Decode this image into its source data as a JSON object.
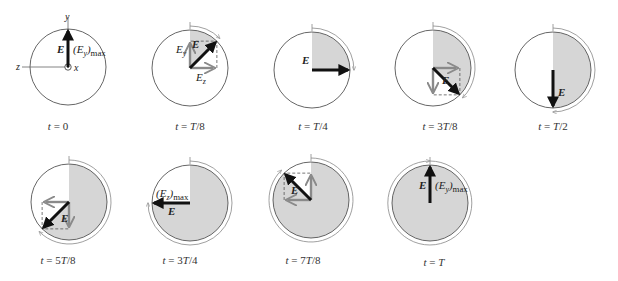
{
  "figure": {
    "colors": {
      "circle_stroke": "#555555",
      "shade_fill": "#d6d6d6",
      "e_vector": "#111111",
      "component_vector": "#8a8a8a",
      "sweep_arc": "#888888",
      "axis": "#666666"
    },
    "radius": 38,
    "panels": [
      {
        "id": "t0",
        "caption": "t = 0",
        "cx": 68,
        "cy": 67,
        "angle_deg": 0,
        "caption_x": 58,
        "caption_y": 130,
        "axes": true,
        "axis_labels": {
          "y": "y",
          "z": "z",
          "x": "x"
        },
        "e_label": "E",
        "mag_label": "(E_y)max",
        "components": false
      },
      {
        "id": "t_T8",
        "caption": "t = T/8",
        "cx": 190,
        "cy": 68,
        "angle_deg": 45,
        "caption_x": 190,
        "caption_y": 130,
        "axes": false,
        "e_label": "E",
        "components": true,
        "comp_labels": {
          "y": "E_y",
          "z": "E_z"
        }
      },
      {
        "id": "t_T4",
        "caption": "t = T/4",
        "cx": 312,
        "cy": 70,
        "angle_deg": 90,
        "caption_x": 313,
        "caption_y": 130,
        "axes": false,
        "e_label": "E",
        "components": false
      },
      {
        "id": "t_3T8",
        "caption": "t = 3T/8",
        "cx": 433,
        "cy": 68,
        "angle_deg": 135,
        "caption_x": 440,
        "caption_y": 130,
        "axes": false,
        "e_label": "E",
        "components": true
      },
      {
        "id": "t_T2",
        "caption": "t = T/2",
        "cx": 553,
        "cy": 70,
        "angle_deg": 180,
        "caption_x": 553,
        "caption_y": 130,
        "axes": false,
        "e_label": "E",
        "components": false
      },
      {
        "id": "t_5T8",
        "caption": "t = 5T/8",
        "cx": 69,
        "cy": 202,
        "angle_deg": 225,
        "caption_x": 58,
        "caption_y": 264,
        "axes": false,
        "e_label": "E",
        "components": true
      },
      {
        "id": "t_3T4",
        "caption": "t = 3T/4",
        "cx": 190,
        "cy": 203,
        "angle_deg": 270,
        "caption_x": 180,
        "caption_y": 264,
        "axes": false,
        "e_label": "E",
        "mag_label": "(E_z)max",
        "components": false
      },
      {
        "id": "t_7T8",
        "caption": "t = 7T/8",
        "cx": 311,
        "cy": 200,
        "angle_deg": 315,
        "caption_x": 303,
        "caption_y": 264,
        "axes": false,
        "e_label": "E",
        "components": true
      },
      {
        "id": "t_T",
        "caption": "t = T",
        "cx": 430,
        "cy": 203,
        "angle_deg": 360,
        "caption_x": 434,
        "caption_y": 266,
        "axes": false,
        "e_label": "E",
        "mag_label": "(E_y)max",
        "components": false
      }
    ]
  }
}
